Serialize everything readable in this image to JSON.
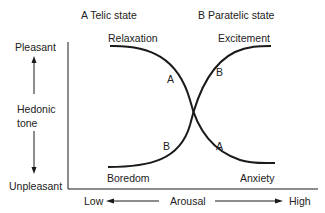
{
  "diagram": {
    "title_a": "A Telic state",
    "title_b": "B Paratelic state",
    "y_axis": {
      "top_label": "Pleasant",
      "middle_label_line1": "Hedonic",
      "middle_label_line2": "tone",
      "bottom_label": "Unpleasant"
    },
    "x_axis": {
      "left_label": "Low",
      "middle_label": "Arousal",
      "right_label": "High"
    },
    "curve_labels": {
      "top_left": "Relaxation",
      "top_right": "Excitement",
      "bottom_left": "Boredom",
      "bottom_right": "Anxiety",
      "curve_a_upper": "A",
      "curve_b_upper": "B",
      "curve_b_lower": "B",
      "curve_a_lower": "A"
    },
    "curves": [
      {
        "name": "A",
        "state": "Telic",
        "from": "Relaxation",
        "to": "Anxiety"
      },
      {
        "name": "B",
        "state": "Paratelic",
        "from": "Boredom",
        "to": "Excitement"
      }
    ],
    "colors": {
      "line": "#1a1a1a",
      "text": "#222222",
      "background": "#ffffff"
    }
  }
}
